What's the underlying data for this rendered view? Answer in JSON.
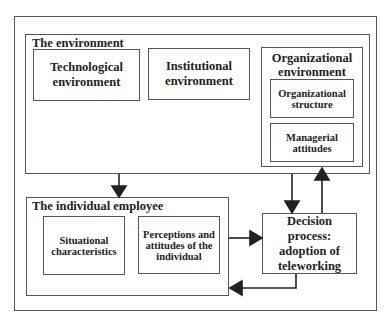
{
  "diagram": {
    "environment": {
      "title": "The environment",
      "technological": "Technological environment",
      "institutional": "Institutional environment",
      "organizational": {
        "title": "Organizational environment",
        "structure": "Organizational structure",
        "managerial": "Managerial attitudes"
      }
    },
    "individual": {
      "title": "The individual employee",
      "situational": "Situational characteristics",
      "perceptions": "Perceptions and attitudes of the individual"
    },
    "decision": "Decision process: adoption of teleworking",
    "colors": {
      "line": "#555555",
      "arrow": "#222222",
      "background": "#ffffff"
    }
  }
}
